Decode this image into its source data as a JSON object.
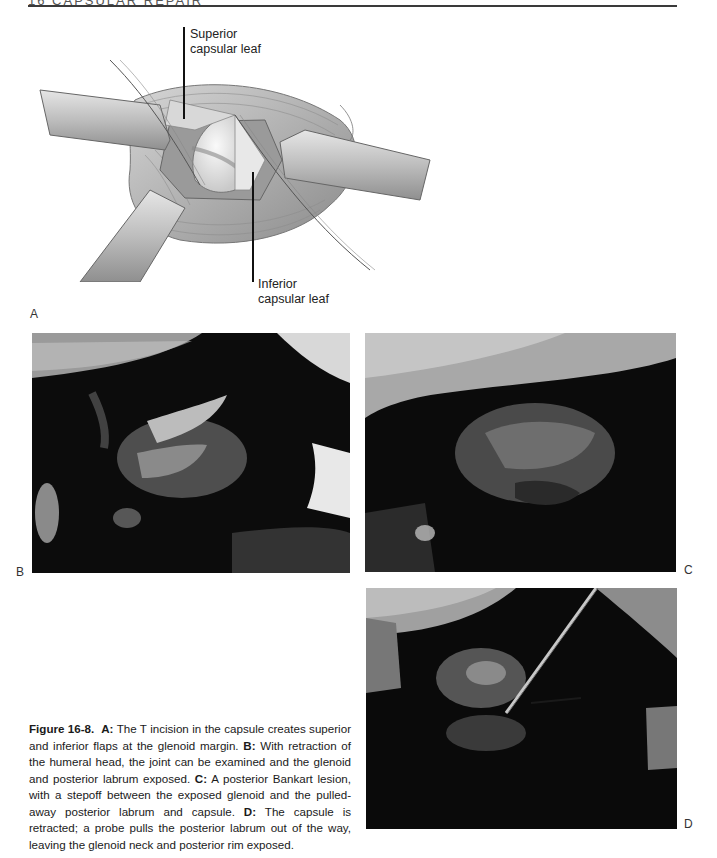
{
  "page": {
    "running_head": "16   CAPSULAR REPAIR"
  },
  "figure": {
    "panel_a": {
      "letter": "A",
      "labels": {
        "superior_line1": "Superior",
        "superior_line2": "capsular leaf",
        "inferior_line1": "Inferior",
        "inferior_line2": "capsular leaf"
      }
    },
    "panel_b": {
      "letter": "B"
    },
    "panel_c": {
      "letter": "C"
    },
    "panel_d": {
      "letter": "D"
    },
    "caption": {
      "figure_label": "Figure 16-8.",
      "a_label": "A:",
      "a_text": " The T incision in the capsule creates superior and inferior flaps at the glenoid margin. ",
      "b_label": "B:",
      "b_text": " With retraction of the humeral head, the joint can be examined and the glenoid and posterior labrum exposed. ",
      "c_label": "C:",
      "c_text": " A posterior Bankart lesion, with a stepoff between the exposed glenoid and the pulled-away posterior labrum and capsule. ",
      "d_label": "D:",
      "d_text": " The capsule is retracted; a probe pulls the posterior labrum out of the way, leaving the glenoid neck and posterior rim exposed."
    }
  },
  "colors": {
    "rule": "#3a3a3a",
    "photo_dark": "#0d0d0d",
    "illustration_gray": "#bdbdbd"
  }
}
